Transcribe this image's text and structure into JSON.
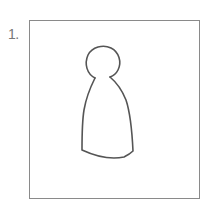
{
  "item": {
    "number_label": "1.",
    "figure": "peg-doll-outline",
    "stroke_color": "#555555",
    "frame_color": "#8a8a8a"
  }
}
